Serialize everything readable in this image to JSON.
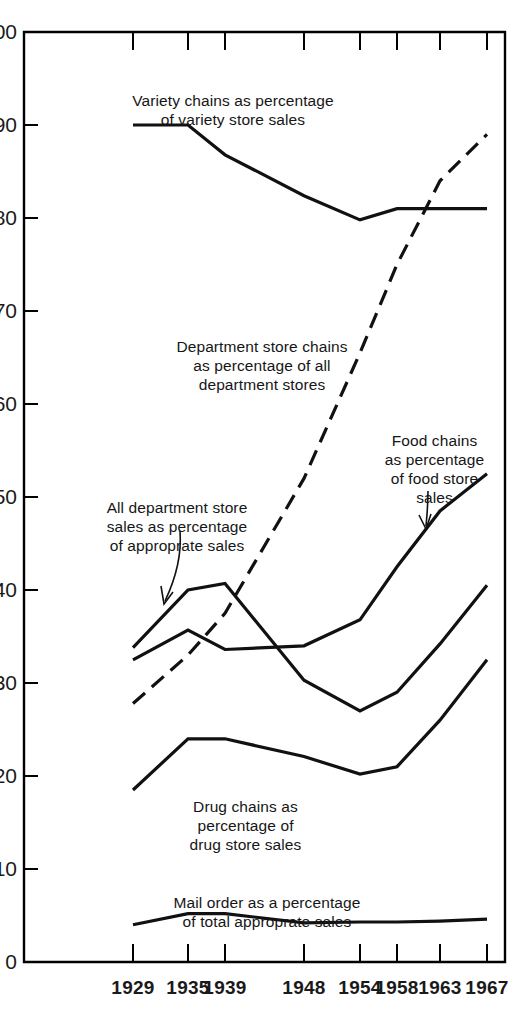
{
  "chart_data": {
    "type": "line",
    "title": "",
    "subtitle": "",
    "xlabel": "",
    "ylabel": "",
    "x": [
      1929,
      1935,
      1939,
      1948,
      1954,
      1958,
      1963,
      1967
    ],
    "categories": [
      "1929",
      "1935",
      "1939",
      "1948",
      "1954",
      "1958",
      "1963",
      "1967"
    ],
    "xlim": [
      1929,
      1967
    ],
    "ylim": [
      0,
      100
    ],
    "ytick_labels": [
      "0",
      "10",
      "20",
      "30",
      "40",
      "50",
      "60",
      "70",
      "80",
      "90",
      "100"
    ],
    "ytick_values": [
      0,
      10,
      20,
      30,
      40,
      50,
      60,
      70,
      80,
      90,
      100
    ],
    "grid": false,
    "legend_position": "inline-annotations",
    "series": [
      {
        "name": "Variety chains as percentage of variety store sales",
        "style": "solid",
        "values": [
          90.0,
          90.0,
          86.8,
          82.4,
          79.8,
          81.0,
          81.0,
          81.0
        ]
      },
      {
        "name": "Department store chains as percentage of all department stores",
        "style": "dashed",
        "values": [
          27.8,
          33.0,
          37.5,
          52.0,
          65.5,
          75.0,
          84.0,
          89.0
        ]
      },
      {
        "name": "Food chains as percentage of food store sales",
        "style": "solid",
        "values": [
          32.5,
          35.7,
          33.6,
          34.0,
          36.8,
          42.5,
          48.5,
          52.5
        ]
      },
      {
        "name": "All department store sales as percentage of approprate sales",
        "style": "solid",
        "values": [
          33.8,
          40.0,
          40.7,
          30.3,
          27.0,
          29.0,
          34.2,
          40.5
        ]
      },
      {
        "name": "Drug chains as percentage of drug store sales",
        "style": "solid",
        "values": [
          18.5,
          24.0,
          24.0,
          22.1,
          20.2,
          21.0,
          26.0,
          32.5
        ]
      },
      {
        "name": "Mail order as a percentage of total approprate sales",
        "style": "solid",
        "values": [
          4.0,
          5.2,
          5.2,
          4.2,
          4.3,
          4.3,
          4.4,
          4.6
        ]
      }
    ],
    "annotations": [
      {
        "id": "variety",
        "text": "Variety chains as percentage\nof variety store sales",
        "x": 233,
        "y": 72,
        "leader": false
      },
      {
        "id": "department-chains",
        "text": "Department store chains\nas percentage of all\ndepartment stores",
        "x": 262,
        "y": 318,
        "leader": false
      },
      {
        "id": "food-chains",
        "text": "Food chains\nas percentage\nof food store\nsales",
        "x": 434,
        "y": 412,
        "leader": true
      },
      {
        "id": "all-department",
        "text": "All department store\nsales as percentage\nof approprate sales",
        "x": 174,
        "y": 479,
        "leader": true
      },
      {
        "id": "drug-chains",
        "text": "Drug chains as\npercentage of\ndrug store sales",
        "x": 245,
        "y": 778,
        "leader": false
      },
      {
        "id": "mail-order",
        "text": "Mail order as a percentage\nof total approprate sales",
        "x": 267,
        "y": 874,
        "leader": false
      }
    ],
    "colors": {
      "line": "#111111",
      "axis": "#000000",
      "text": "#161616",
      "background": "#ffffff"
    }
  }
}
